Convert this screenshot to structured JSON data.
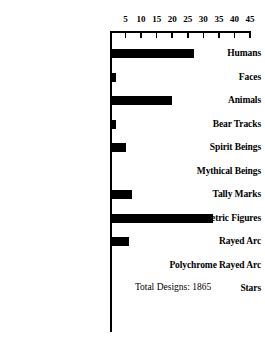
{
  "chart_data": {
    "type": "bar",
    "orientation": "horizontal",
    "title": "",
    "subtitle": "",
    "xlabel": "",
    "ylabel": "",
    "xlim": [
      0,
      45
    ],
    "grid": false,
    "legend": null,
    "xticks": [
      5,
      10,
      15,
      20,
      25,
      30,
      35,
      40,
      45
    ],
    "xtick_labels": [
      "5",
      "10",
      "15",
      "20",
      "25",
      "30",
      "35",
      "40",
      "45"
    ],
    "categories": [
      "Humans",
      "Faces",
      "Animals",
      "Bear Tracks",
      "Spirit Beings",
      "Mythical Beings",
      "Tally Marks",
      "Geometric Figures",
      "Rayed Arc",
      "Polychrome Rayed Arc",
      "Stars"
    ],
    "values": [
      27,
      2,
      20,
      2,
      5,
      0,
      7,
      33,
      6,
      0,
      0
    ],
    "annotations": [
      {
        "text": "Total Designs: 1865",
        "x": 8,
        "y_category": "Stars"
      }
    ],
    "bar_color": "#000000",
    "axis_color": "#000000"
  },
  "annotation": {
    "total_designs_label": "Total Designs: 1865"
  }
}
